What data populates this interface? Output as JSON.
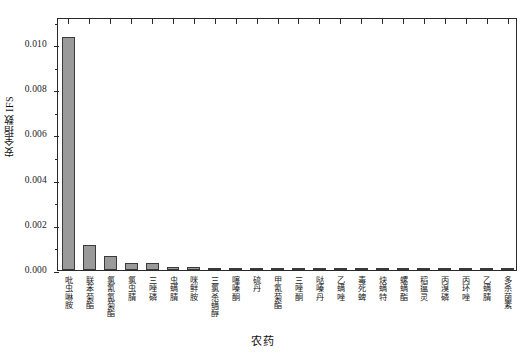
{
  "chart_data": {
    "type": "bar",
    "title": "",
    "xlabel": "农药",
    "ylabel": "安全指数 IFS",
    "ylim": [
      0,
      0.0112
    ],
    "grid": false,
    "legend": null,
    "ytick_labels": [
      "0.000",
      "0.002",
      "0.004",
      "0.006",
      "0.008",
      "0.010"
    ],
    "ytick_values": [
      0.0,
      0.002,
      0.004,
      0.006,
      0.008,
      0.01
    ],
    "minor_ytick_values": [
      0.001,
      0.003,
      0.005,
      0.007,
      0.009,
      0.011
    ],
    "bar_color": "#9a9a9a",
    "bar_edge_color": "#3a3a3a",
    "categories": [
      "吡虫啉胺",
      "联苯菊酯",
      "氯氰氰菊酯",
      "氯虫腈",
      "三唑磷",
      "虫螨腈",
      "咪鲜胺",
      "三氯杀螨醇",
      "噻嗪酮",
      "硫丹",
      "甲氰菊酯",
      "三唑酮",
      "哒嗪丹",
      "乙螨唑",
      "毒死蜱",
      "炔螨特",
      "螺螨酯",
      "稻瘟灵",
      "丙溴磷",
      "丙环唑",
      "乙螨腈",
      "多杀菌素"
    ],
    "values": [
      0.0103,
      0.00112,
      0.0006,
      0.00033,
      0.00032,
      0.00014,
      0.00012,
      0.0001,
      8e-05,
      7e-05,
      6e-05,
      5e-05,
      4e-05,
      3e-05,
      3e-05,
      2e-05,
      2e-05,
      2e-05,
      1e-05,
      1e-05,
      1e-05,
      1e-05
    ]
  }
}
